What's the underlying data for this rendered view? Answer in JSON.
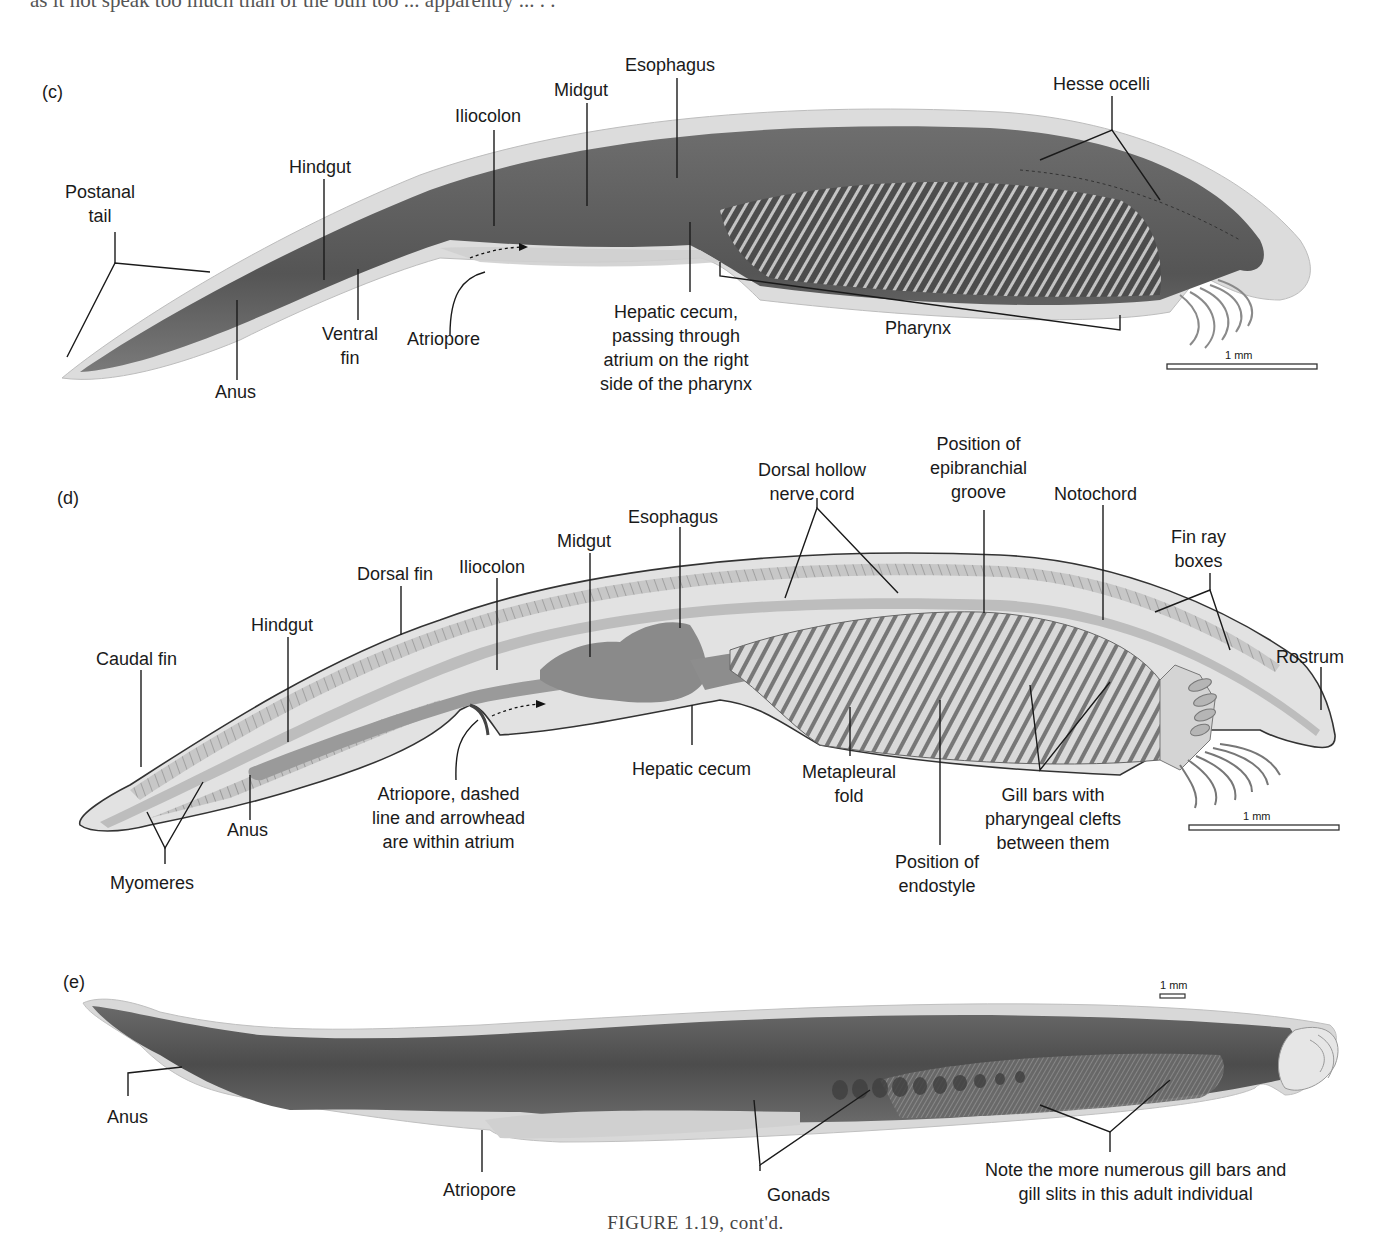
{
  "page": {
    "top_text_fragment": "as it.. speaks too much... ...apparently ..."
  },
  "figure": {
    "caption": "FIGURE 1.19, cont'd.",
    "colors": {
      "specimen_dark": "#5a5a5a",
      "specimen_light": "#d8d8d8",
      "drawing_fill": "#cfcfcf",
      "drawing_dark": "#8a8a8a",
      "line": "#1a1a1a"
    }
  },
  "panel_c": {
    "letter": "(c)",
    "scale_bar": "1 mm",
    "labels": {
      "postanal_tail": "Postanal\ntail",
      "hindgut": "Hindgut",
      "iliocolon": "Iliocolon",
      "midgut": "Midgut",
      "esophagus": "Esophagus",
      "hesse_ocelli": "Hesse ocelli",
      "anus": "Anus",
      "ventral_fin": "Ventral\nfin",
      "atriopore": "Atriopore",
      "hepatic_cecum": "Hepatic cecum,\npassing through\natrium on the right\nside of the pharynx",
      "pharynx": "Pharynx"
    }
  },
  "panel_d": {
    "letter": "(d)",
    "scale_bar": "1 mm",
    "labels": {
      "caudal_fin": "Caudal fin",
      "hindgut": "Hindgut",
      "dorsal_fin": "Dorsal fin",
      "iliocolon": "Iliocolon",
      "midgut": "Midgut",
      "esophagus": "Esophagus",
      "dorsal_hollow_nerve_cord": "Dorsal hollow\nnerve cord",
      "epibranchial_groove": "Position of\nepibranchial\ngroove",
      "notochord": "Notochord",
      "fin_ray_boxes": "Fin ray\nboxes",
      "rostrum": "Rostrum",
      "anus": "Anus",
      "myomeres": "Myomeres",
      "atriopore": "Atriopore, dashed\nline and arrowhead\nare within atrium",
      "hepatic_cecum": "Hepatic cecum",
      "metapleural_fold": "Metapleural\nfold",
      "endostyle": "Position of\nendostyle",
      "gill_bars": "Gill bars with\npharyngeal clefts\nbetween them"
    }
  },
  "panel_e": {
    "letter": "(e)",
    "scale_bar": "1 mm",
    "labels": {
      "anus": "Anus",
      "atriopore": "Atriopore",
      "gonads": "Gonads",
      "note": "Note the more numerous gill bars and\ngill slits in this adult individual"
    }
  }
}
